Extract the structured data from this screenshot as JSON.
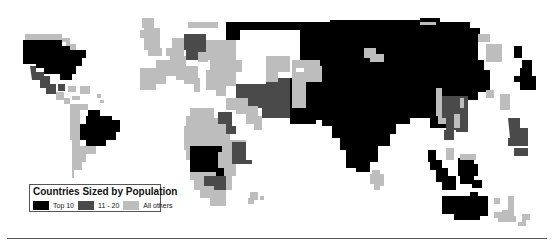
{
  "map": {
    "type": "cartogram",
    "subject": "Countries Sized by Population",
    "colors": {
      "top10": "#000000",
      "rank11_20": "#4a4a4a",
      "others": "#bdbdbd",
      "background": "#ffffff"
    }
  },
  "legend": {
    "title": "Countries Sized by Population",
    "items": [
      {
        "label": "Top 10",
        "color": "#000000"
      },
      {
        "label": "11 - 20",
        "color": "#4a4a4a"
      },
      {
        "label": "All others",
        "color": "#bdbdbd"
      }
    ]
  }
}
